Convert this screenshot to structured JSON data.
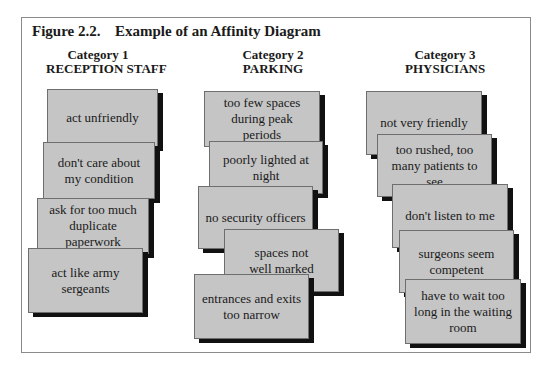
{
  "figure": {
    "number": "Figure 2.2.",
    "title": "Example of an Affinity Diagram"
  },
  "categories": [
    {
      "label": "Category 1",
      "name": "RECEPTION STAFF",
      "cards": [
        {
          "text": "act unfriendly"
        },
        {
          "text": "don't care about my condition"
        },
        {
          "text": "ask for too much duplicate paperwork"
        },
        {
          "text": "act like army sergeants"
        }
      ]
    },
    {
      "label": "Category 2",
      "name": "PARKING",
      "cards": [
        {
          "text": "too few spaces during peak periods"
        },
        {
          "text": "poorly lighted at night"
        },
        {
          "text": "no security officers"
        },
        {
          "text": "spaces not well marked"
        },
        {
          "text": "entrances and exits too narrow"
        }
      ]
    },
    {
      "label": "Category 3",
      "name": "PHYSICIANS",
      "cards": [
        {
          "text": "not very friendly"
        },
        {
          "text": "too rushed, too many patients to see"
        },
        {
          "text": "don't listen to me"
        },
        {
          "text": "surgeons seem competent"
        },
        {
          "text": "have to wait too long in the waiting room"
        }
      ]
    }
  ],
  "colors": {
    "card_fill": "#c5c5c5",
    "card_border": "#6e6e6e",
    "card_shadow": "#111111",
    "frame_border": "#8a8a8a"
  }
}
